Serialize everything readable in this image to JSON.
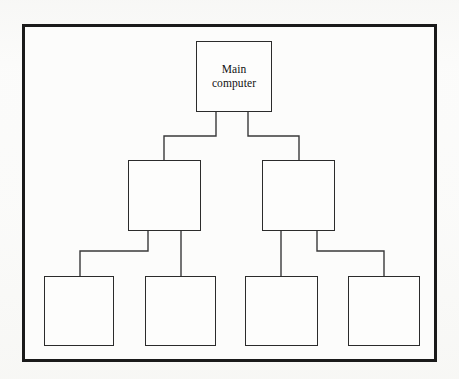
{
  "diagram": {
    "type": "tree",
    "orientation": "top-down",
    "levels": 3,
    "background_color": "#fcfcfb",
    "frame": {
      "name": "outer-frame",
      "x": 22,
      "y": 24,
      "width": 415,
      "height": 338,
      "border_color": "#1a1a1a",
      "border_width": 3
    },
    "node_style": {
      "border_color": "#2b2b2b",
      "border_width": 1.6,
      "fill": "#fdfdfc",
      "font_size": 11.5
    },
    "edge_style": {
      "color": "#39393a",
      "width": 1.4,
      "routing": "orthogonal"
    },
    "nodes": [
      {
        "id": "main-computer",
        "label": "Main\ncomputer",
        "level": 1,
        "x": 196,
        "y": 41,
        "width": 76,
        "height": 71
      },
      {
        "id": "level2-left",
        "label": "",
        "level": 2,
        "x": 128,
        "y": 160,
        "width": 73,
        "height": 71
      },
      {
        "id": "level2-right",
        "label": "",
        "level": 2,
        "x": 262,
        "y": 160,
        "width": 73,
        "height": 71
      },
      {
        "id": "level3-box1",
        "label": "",
        "level": 3,
        "x": 44,
        "y": 276,
        "width": 70,
        "height": 70
      },
      {
        "id": "level3-box2",
        "label": "",
        "level": 3,
        "x": 145,
        "y": 276,
        "width": 71,
        "height": 70
      },
      {
        "id": "level3-box3",
        "label": "",
        "level": 3,
        "x": 245,
        "y": 276,
        "width": 73,
        "height": 70
      },
      {
        "id": "level3-box4",
        "label": "",
        "level": 3,
        "x": 348,
        "y": 276,
        "width": 72,
        "height": 70
      }
    ],
    "edges": [
      {
        "id": "edge-main-to-left",
        "from": "main-computer",
        "to": "level2-left",
        "path": "M 216 112 L 216 136 L 164 136 L 164 160"
      },
      {
        "id": "edge-main-to-right",
        "from": "main-computer",
        "to": "level2-right",
        "path": "M 248 112 L 248 136 L 299 136 L 299 160"
      },
      {
        "id": "edge-left-to-box1",
        "from": "level2-left",
        "to": "level3-box1",
        "path": "M 148 231 L 148 251 L 80 251 L 80 276"
      },
      {
        "id": "edge-left-to-box2",
        "from": "level2-left",
        "to": "level3-box2",
        "path": "M 181 231 L 181 276"
      },
      {
        "id": "edge-right-to-box3",
        "from": "level2-right",
        "to": "level3-box3",
        "path": "M 281 231 L 281 276"
      },
      {
        "id": "edge-right-to-box4",
        "from": "level2-right",
        "to": "level3-box4",
        "path": "M 317 231 L 317 251 L 384 251 L 384 276"
      }
    ]
  }
}
